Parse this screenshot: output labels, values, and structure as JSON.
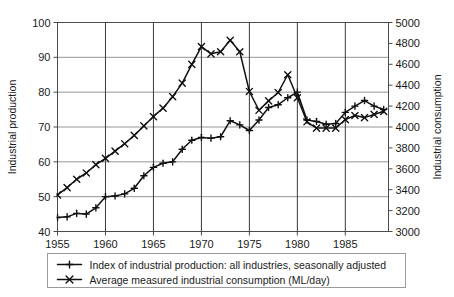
{
  "chart_data": {
    "type": "line",
    "title": "",
    "xlabel": "",
    "grid": true,
    "legend_position": "bottom",
    "x": [
      1955,
      1956,
      1957,
      1958,
      1959,
      1960,
      1961,
      1962,
      1963,
      1964,
      1965,
      1966,
      1967,
      1968,
      1969,
      1970,
      1971,
      1972,
      1973,
      1974,
      1975,
      1976,
      1977,
      1978,
      1979,
      1980,
      1981,
      1982,
      1983,
      1984,
      1985,
      1986,
      1987,
      1988,
      1989
    ],
    "xlim": [
      1955,
      1989.5
    ],
    "xticks": [
      1955,
      1960,
      1965,
      1970,
      1975,
      1980,
      1985
    ],
    "xticklabels": [
      "1955",
      "1960",
      "1965",
      "1970",
      "1975",
      "1980",
      "1985"
    ],
    "left_axis": {
      "label": "Industrial production",
      "lim": [
        40,
        100
      ],
      "ticks": [
        40,
        50,
        60,
        70,
        80,
        90,
        100
      ],
      "ticklabels": [
        "40",
        "50",
        "60",
        "70",
        "80",
        "90",
        "100"
      ]
    },
    "right_axis": {
      "label": "Industrial consumption",
      "lim": [
        3000,
        5000
      ],
      "ticks": [
        3000,
        3200,
        3400,
        3600,
        3800,
        4000,
        4200,
        4400,
        4600,
        4800,
        5000
      ],
      "ticklabels": [
        "3000",
        "3200",
        "3400",
        "3600",
        "3800",
        "4000",
        "4200",
        "4400",
        "4600",
        "4800",
        "5000"
      ]
    },
    "series": [
      {
        "name": "Index of industrial production: all industries, seasonally adjusted",
        "axis": "left",
        "marker": "plus",
        "color": "#111111",
        "values": [
          44.0,
          44.2,
          45.2,
          45.0,
          46.8,
          50.0,
          50.2,
          50.8,
          52.4,
          56.0,
          58.4,
          59.6,
          60.0,
          63.6,
          66.2,
          67.0,
          66.8,
          67.2,
          71.8,
          70.6,
          69.0,
          72.0,
          75.6,
          76.4,
          78.4,
          80.0,
          72.0,
          71.6,
          70.8,
          71.0,
          74.2,
          76.0,
          77.6,
          76.0,
          75.0
        ]
      },
      {
        "name": "Average measured industrial consumption (ML/day)",
        "axis": "right",
        "marker": "cross",
        "color": "#111111",
        "values": [
          3350,
          3420,
          3500,
          3560,
          3640,
          3700,
          3770,
          3840,
          3920,
          4010,
          4100,
          4180,
          4290,
          4420,
          4600,
          4770,
          4700,
          4720,
          4830,
          4720,
          4340,
          4160,
          4250,
          4330,
          4500,
          4280,
          4050,
          3990,
          3990,
          3990,
          4070,
          4110,
          4090,
          4120,
          4150
        ]
      }
    ],
    "legend": [
      {
        "label": "Index of industrial production: all industries, seasonally adjusted",
        "marker": "plus"
      },
      {
        "label": "Average measured industrial consumption (ML/day)",
        "marker": "cross"
      }
    ]
  }
}
